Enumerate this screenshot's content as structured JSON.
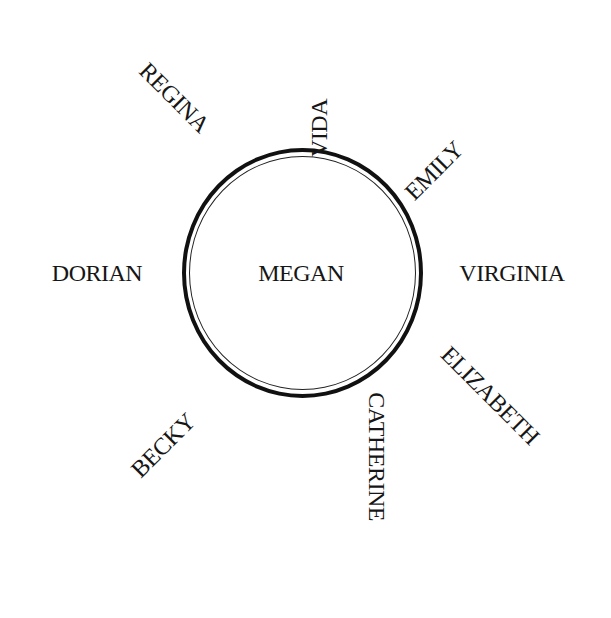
{
  "diagram": {
    "center": {
      "label": "MEGAN"
    },
    "nodes": [
      {
        "id": "vida",
        "label": "VIDA",
        "position": "top",
        "rotation_deg": -90
      },
      {
        "id": "emily",
        "label": "EMILY",
        "position": "top-right",
        "rotation_deg": -45
      },
      {
        "id": "virginia",
        "label": "VIRGINIA",
        "position": "right",
        "rotation_deg": 0
      },
      {
        "id": "elizabeth",
        "label": "ELIZABETH",
        "position": "bottom-right",
        "rotation_deg": 45
      },
      {
        "id": "catherine",
        "label": "CATHERINE",
        "position": "bottom",
        "rotation_deg": 90
      },
      {
        "id": "becky",
        "label": "BECKY",
        "position": "bottom-left",
        "rotation_deg": -45
      },
      {
        "id": "dorian",
        "label": "DORIAN",
        "position": "left",
        "rotation_deg": 0
      },
      {
        "id": "regina",
        "label": "REGINA",
        "position": "top-left",
        "rotation_deg": 45
      }
    ],
    "colors": {
      "ink": "#161616",
      "background": "#ffffff"
    }
  }
}
